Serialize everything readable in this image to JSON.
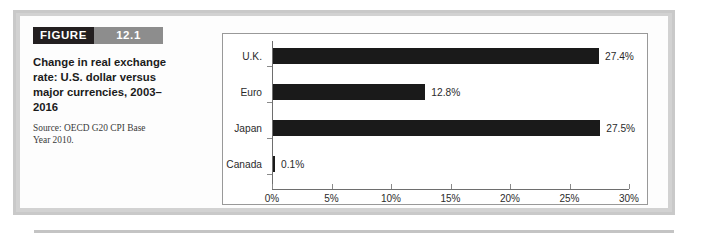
{
  "figure": {
    "tag_word": "FIGURE",
    "number": "12.1",
    "title": "Change in real exchange rate: U.S. dollar versus major currencies, 2003–2016",
    "source": "Source: OECD G20 CPI Base Year 2010."
  },
  "colors": {
    "tag_background": "#231f20",
    "number_background": "#8d8d8d",
    "bar": "#1a1a1a",
    "axis": "#6e6e6e",
    "card": "#fdfdfd",
    "page_gray": "#d2d2d2"
  },
  "chart_data": {
    "type": "bar",
    "orientation": "horizontal",
    "title": "Change in real exchange rate: U.S. dollar versus major currencies, 2003–2016",
    "xlabel": "",
    "ylabel": "",
    "categories": [
      "U.K.",
      "Euro",
      "Japan",
      "Canada"
    ],
    "values": [
      27.4,
      12.8,
      27.5,
      0.1
    ],
    "data_labels": [
      "27.4%",
      "12.8%",
      "27.5%",
      "0.1%"
    ],
    "xlim": [
      0,
      30
    ],
    "x_ticks": [
      0,
      5,
      10,
      15,
      20,
      25,
      30
    ],
    "x_tick_labels": [
      "0%",
      "5%",
      "10%",
      "15%",
      "20%",
      "25%",
      "30%"
    ],
    "grid": false,
    "legend": false,
    "legend_position": "none",
    "series": [
      {
        "name": "Change in real exchange rate",
        "values": [
          27.4,
          12.8,
          27.5,
          0.1
        ]
      }
    ]
  }
}
